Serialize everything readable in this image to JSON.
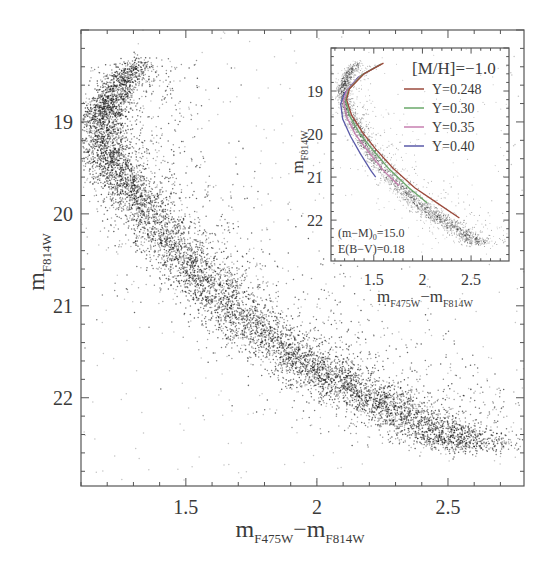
{
  "chart_data": [
    {
      "id": "main",
      "type": "scatter",
      "title": "",
      "xlabel": "m_F475W − m_F814W",
      "xlabel_parts": {
        "main1": "m",
        "sub1": "F475W",
        "sep": "−",
        "main2": "m",
        "sub2": "F814W"
      },
      "ylabel": "m_F814W",
      "ylabel_parts": {
        "main": "m",
        "sub": "F814W"
      },
      "xlim": [
        1.1,
        2.79
      ],
      "ylim": [
        22.96,
        18.0
      ],
      "y_inverted": true,
      "grid": false,
      "xticks": [
        1.5,
        2,
        2.5
      ],
      "xtick_labels": [
        "1.5",
        "2",
        "2.5"
      ],
      "yticks": [
        19,
        20,
        21,
        22
      ],
      "ytick_labels": [
        "19",
        "20",
        "21",
        "22"
      ],
      "series": [
        {
          "name": "observed stars (CMD main sequence ridge)",
          "color": "#1a1a1a",
          "ridge": [
            {
              "x": 1.33,
              "y": 18.35
            },
            {
              "x": 1.25,
              "y": 18.55
            },
            {
              "x": 1.2,
              "y": 18.8
            },
            {
              "x": 1.18,
              "y": 19.0
            },
            {
              "x": 1.2,
              "y": 19.3
            },
            {
              "x": 1.25,
              "y": 19.6
            },
            {
              "x": 1.33,
              "y": 19.9
            },
            {
              "x": 1.42,
              "y": 20.25
            },
            {
              "x": 1.53,
              "y": 20.6
            },
            {
              "x": 1.65,
              "y": 20.95
            },
            {
              "x": 1.8,
              "y": 21.3
            },
            {
              "x": 1.95,
              "y": 21.6
            },
            {
              "x": 2.1,
              "y": 21.85
            },
            {
              "x": 2.28,
              "y": 22.1
            },
            {
              "x": 2.45,
              "y": 22.35
            },
            {
              "x": 2.6,
              "y": 22.55
            }
          ],
          "spread": 0.045
        }
      ]
    },
    {
      "id": "inset",
      "type": "line",
      "title": "[M/H]=−1.0",
      "xlabel": "m_F475W − m_F814W",
      "xlabel_parts": {
        "main1": "m",
        "sub1": "F475W",
        "sep": "−",
        "main2": "m",
        "sub2": "F814W"
      },
      "ylabel": "m_F814W",
      "ylabel_parts": {
        "main": "m",
        "sub": "F814W"
      },
      "xlim": [
        1.06,
        2.89
      ],
      "ylim": [
        22.95,
        18.0
      ],
      "y_inverted": true,
      "xticks": [
        1.5,
        2,
        2.5
      ],
      "xtick_labels": [
        "1.5",
        "2",
        "2.5"
      ],
      "yticks": [
        19,
        20,
        21,
        22
      ],
      "ytick_labels": [
        "19",
        "20",
        "21",
        "22"
      ],
      "legend_position": "upper right",
      "annotations": [
        {
          "text_main": "(m−M)",
          "text_sub": "0",
          "text_tail": "=15.0"
        },
        {
          "text_main": "E(B−V)=0.18",
          "text_sub": "",
          "text_tail": ""
        }
      ],
      "series": [
        {
          "name": "Y=0.248",
          "color": "#9b4a3c",
          "points": [
            [
              1.6,
              18.35
            ],
            [
              1.4,
              18.6
            ],
            [
              1.25,
              18.95
            ],
            [
              1.22,
              19.2
            ],
            [
              1.27,
              19.55
            ],
            [
              1.38,
              19.95
            ],
            [
              1.52,
              20.35
            ],
            [
              1.7,
              20.8
            ],
            [
              1.92,
              21.25
            ],
            [
              2.15,
              21.6
            ],
            [
              2.38,
              21.95
            ]
          ]
        },
        {
          "name": "Y=0.30",
          "color": "#6aa86a",
          "points": [
            [
              1.58,
              18.37
            ],
            [
              1.38,
              18.62
            ],
            [
              1.24,
              18.97
            ],
            [
              1.21,
              19.22
            ],
            [
              1.25,
              19.57
            ],
            [
              1.35,
              19.97
            ],
            [
              1.49,
              20.37
            ],
            [
              1.66,
              20.82
            ],
            [
              1.86,
              21.25
            ],
            [
              2.05,
              21.6
            ]
          ]
        },
        {
          "name": "Y=0.35",
          "color": "#c77fb0",
          "points": [
            [
              1.57,
              18.38
            ],
            [
              1.36,
              18.65
            ],
            [
              1.22,
              19.0
            ],
            [
              1.19,
              19.25
            ],
            [
              1.22,
              19.6
            ],
            [
              1.31,
              20.0
            ],
            [
              1.44,
              20.4
            ],
            [
              1.6,
              20.85
            ],
            [
              1.76,
              21.2
            ]
          ]
        },
        {
          "name": "Y=0.40",
          "color": "#5a5aa8",
          "points": [
            [
              1.55,
              18.4
            ],
            [
              1.34,
              18.68
            ],
            [
              1.2,
              19.05
            ],
            [
              1.16,
              19.3
            ],
            [
              1.18,
              19.65
            ],
            [
              1.26,
              20.05
            ],
            [
              1.36,
              20.45
            ],
            [
              1.47,
              20.85
            ],
            [
              1.52,
              21.0
            ]
          ]
        }
      ],
      "stars_ridge_ref": "main"
    }
  ]
}
